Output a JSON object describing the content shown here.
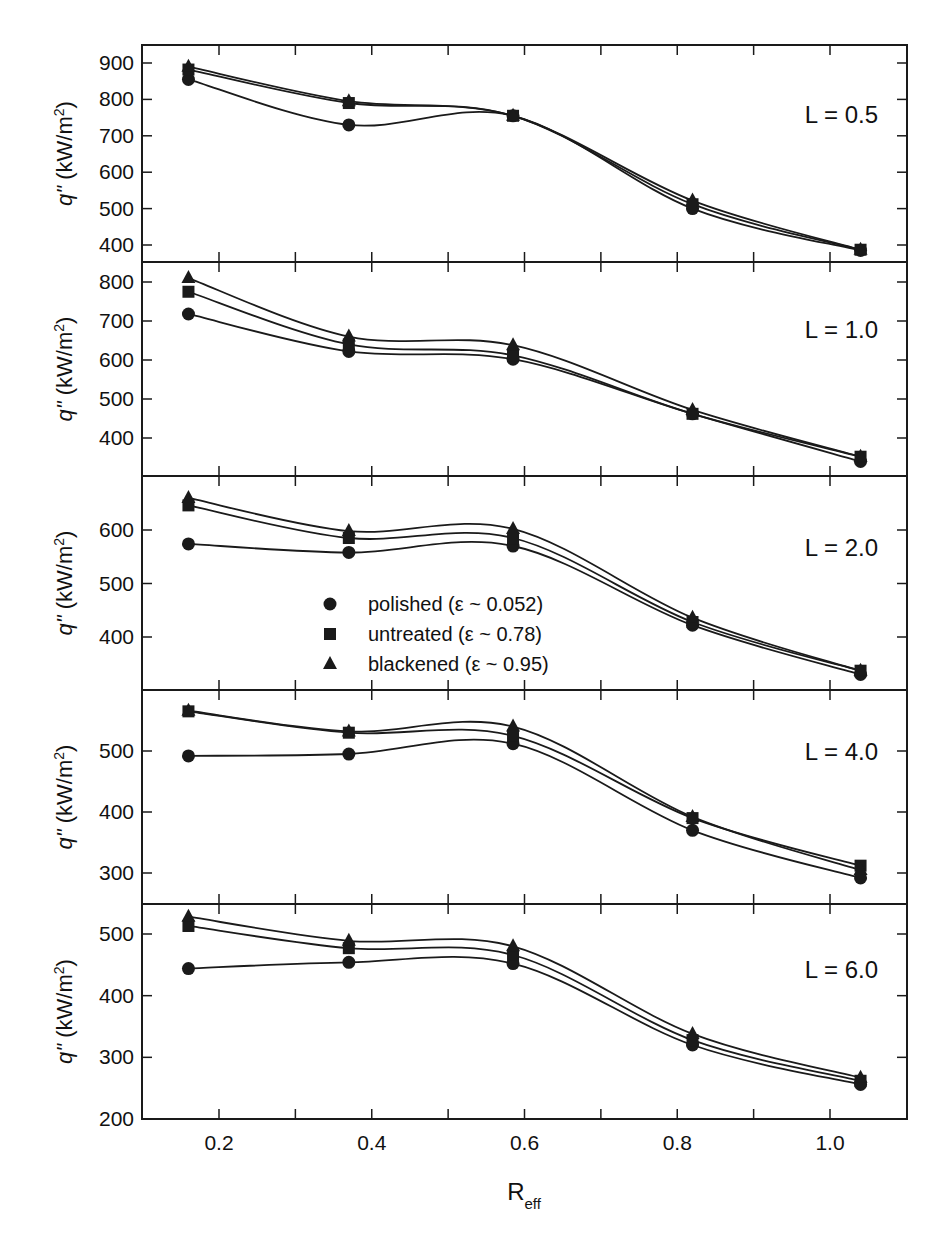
{
  "chart_data": {
    "type": "line",
    "layout": "5 vertically stacked panels sharing x-axis",
    "xlabel": "R",
    "xlabel_subscript": "eff",
    "ylabel": "q\" (kW/m²)",
    "ylabel_parts": {
      "italic": "q\"",
      "unit": " (kW/m",
      "sup": "2",
      "close": ")"
    },
    "xlim": [
      0.1,
      1.1
    ],
    "xticks": [
      0.2,
      0.4,
      0.6,
      0.8,
      1.0
    ],
    "xtick_labels": [
      "0.2",
      "0.4",
      "0.6",
      "0.8",
      "1.0"
    ],
    "x": [
      0.16,
      0.37,
      0.585,
      0.82,
      1.04
    ],
    "grid": false,
    "legend": {
      "position": "inside panel L = 2.0, lower-center",
      "entries": [
        {
          "marker": "circle",
          "label": "polished (ε ~ 0.052)"
        },
        {
          "marker": "square",
          "label": "untreated (ε ~ 0.78)"
        },
        {
          "marker": "triangle",
          "label": "blackened (ε ~ 0.95)"
        }
      ]
    },
    "panels": [
      {
        "label": "L = 0.5",
        "ylim": [
          350,
          950
        ],
        "yticks": [
          400,
          500,
          600,
          700,
          800,
          900
        ],
        "series": [
          {
            "name": "polished (ε ~ 0.052)",
            "marker": "circle",
            "values": [
              855,
              730,
              755,
              500,
              385
            ]
          },
          {
            "name": "untreated (ε ~ 0.78)",
            "marker": "square",
            "values": [
              882,
              790,
              755,
              512,
              387
            ]
          },
          {
            "name": "blackened (ε ~ 0.95)",
            "marker": "triangle",
            "values": [
              890,
              795,
              755,
              522,
              387
            ]
          }
        ]
      },
      {
        "label": "L = 1.0",
        "ylim": [
          310,
          850
        ],
        "yticks": [
          400,
          500,
          600,
          700,
          800
        ],
        "series": [
          {
            "name": "polished (ε ~ 0.052)",
            "marker": "circle",
            "values": [
              718,
              622,
              602,
              462,
              340
            ]
          },
          {
            "name": "untreated (ε ~ 0.78)",
            "marker": "square",
            "values": [
              775,
              640,
              612,
              462,
              352
            ]
          },
          {
            "name": "blackened (ε ~ 0.95)",
            "marker": "triangle",
            "values": [
              810,
              660,
              638,
              472,
              352
            ]
          }
        ]
      },
      {
        "label": "L = 2.0",
        "ylim": [
          310,
          700
        ],
        "yticks": [
          400,
          500,
          600
        ],
        "series": [
          {
            "name": "polished (ε ~ 0.052)",
            "marker": "circle",
            "values": [
              574,
              558,
              570,
              422,
              330
            ]
          },
          {
            "name": "untreated (ε ~ 0.78)",
            "marker": "square",
            "values": [
              646,
              585,
              585,
              428,
              337
            ]
          },
          {
            "name": "blackened (ε ~ 0.95)",
            "marker": "triangle",
            "values": [
              660,
              598,
              602,
              436,
              337
            ]
          }
        ]
      },
      {
        "label": "L = 4.0",
        "ylim": [
          250,
          600
        ],
        "yticks": [
          300,
          400,
          500
        ],
        "series": [
          {
            "name": "polished (ε ~ 0.052)",
            "marker": "circle",
            "values": [
              492,
              495,
              512,
              370,
              292
            ]
          },
          {
            "name": "untreated (ε ~ 0.78)",
            "marker": "square",
            "values": [
              565,
              530,
              525,
              390,
              312
            ]
          },
          {
            "name": "blackened (ε ~ 0.95)",
            "marker": "triangle",
            "values": [
              566,
              532,
              540,
              392,
              305
            ]
          }
        ]
      },
      {
        "label": "L = 6.0",
        "ylim": [
          200,
          550
        ],
        "yticks": [
          200,
          300,
          400,
          500
        ],
        "series": [
          {
            "name": "polished (ε ~ 0.052)",
            "marker": "circle",
            "values": [
              444,
              454,
              452,
              320,
              256
            ]
          },
          {
            "name": "untreated (ε ~ 0.78)",
            "marker": "square",
            "values": [
              513,
              477,
              466,
              328,
              262
            ]
          },
          {
            "name": "blackened (ε ~ 0.95)",
            "marker": "triangle",
            "values": [
              528,
              489,
              480,
              338,
              267
            ]
          }
        ]
      }
    ]
  }
}
